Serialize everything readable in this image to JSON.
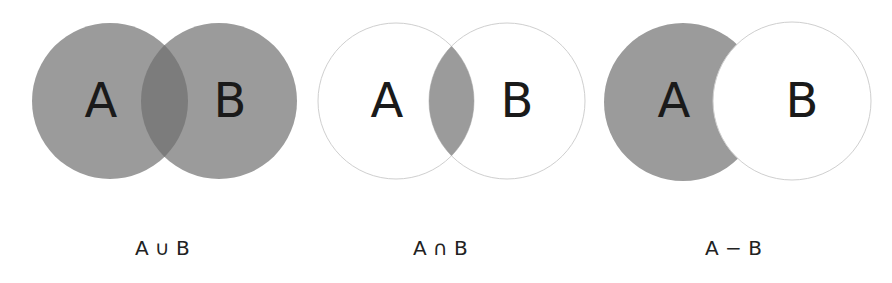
{
  "colors": {
    "fill": "#9b9b9b",
    "overlap": "#7c7c7c",
    "outline": "#c8c8c8",
    "background": "#ffffff",
    "text": "#1a1a1a"
  },
  "diagrams": [
    {
      "name": "union",
      "set_a_label": "A",
      "set_b_label": "B",
      "caption": "A ∪ B",
      "shaded_region": "A union B"
    },
    {
      "name": "intersection",
      "set_a_label": "A",
      "set_b_label": "B",
      "caption": "A ∩ B",
      "shaded_region": "A intersect B"
    },
    {
      "name": "difference",
      "set_a_label": "A",
      "set_b_label": "B",
      "caption": "A − B",
      "shaded_region": "A minus B"
    }
  ]
}
